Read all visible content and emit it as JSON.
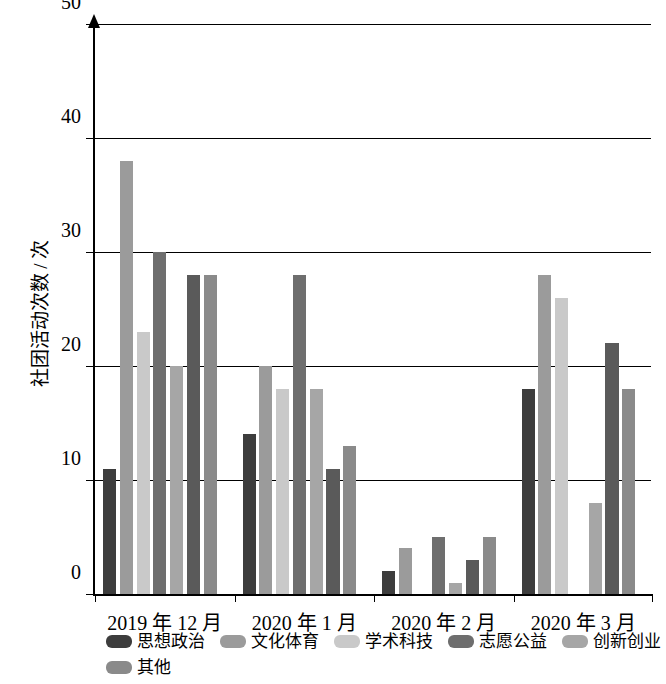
{
  "chart_data": {
    "type": "bar",
    "title": "",
    "xlabel": "",
    "ylabel": "社团活动次数 / 次",
    "ylim": [
      0,
      50
    ],
    "yticks": [
      0,
      10,
      20,
      30,
      40,
      50
    ],
    "grid": true,
    "legend_position": "bottom",
    "categories": [
      "2019 年 12 月",
      "2020 年 1 月",
      "2020 年 2 月",
      "2020 年 3 月"
    ],
    "series": [
      {
        "name": "思想政治",
        "color": "#3d3d3d",
        "values": [
          11,
          14,
          2,
          18
        ]
      },
      {
        "name": "文化体育",
        "color": "#9b9b9b",
        "values": [
          38,
          20,
          4,
          28
        ]
      },
      {
        "name": "学术科技",
        "color": "#c9c9c9",
        "values": [
          23,
          18,
          0,
          26
        ]
      },
      {
        "name": "志愿公益",
        "color": "#6e6e6e",
        "values": [
          30,
          28,
          5,
          0
        ]
      },
      {
        "name": "创新创业",
        "color": "#a6a6a6",
        "values": [
          20,
          18,
          1,
          8
        ]
      },
      {
        "name": "自律互助",
        "color": "#5a5a5a",
        "values": [
          28,
          11,
          3,
          22
        ]
      },
      {
        "name": "其他",
        "color": "#8a8a8a",
        "values": [
          28,
          13,
          5,
          18
        ]
      }
    ]
  },
  "axis": {
    "y_title": "社团活动次数 / 次",
    "tick_labels": [
      "50",
      "40",
      "30",
      "20",
      "10",
      "0"
    ]
  },
  "legend": {
    "row1": [
      "思想政治",
      "文化体育",
      "学术科技",
      "志愿公益",
      "创新创业",
      "自律互助"
    ],
    "row2": [
      "其他"
    ]
  }
}
